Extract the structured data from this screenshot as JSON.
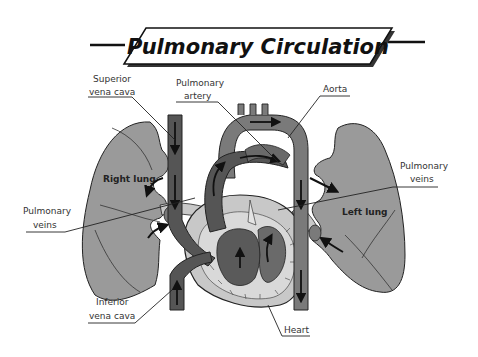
{
  "title": "Pulmonary Circulation",
  "labels": {
    "superior_vena_cava": [
      "Superior",
      "vena cava"
    ],
    "pulmonary_artery": [
      "Pulmonary",
      "artery"
    ],
    "aorta": "Aorta",
    "pulmonary_veins_left_side": [
      "Pulmonary",
      "veins"
    ],
    "pulmonary_veins_right_side": [
      "Pulmonary",
      "veins"
    ],
    "right_lung": "Right lung",
    "left_lung": "Left lung",
    "inferior_vena_cava": [
      "Inferior",
      "vena cava"
    ],
    "heart": "Heart"
  },
  "colors": {
    "lung": "#9a9a9a",
    "vessel_dark": "#555555",
    "vessel_mid": "#7a7a7a",
    "heart_light": "#c8c8c8",
    "outline": "#222222",
    "arrow": "#111111"
  }
}
